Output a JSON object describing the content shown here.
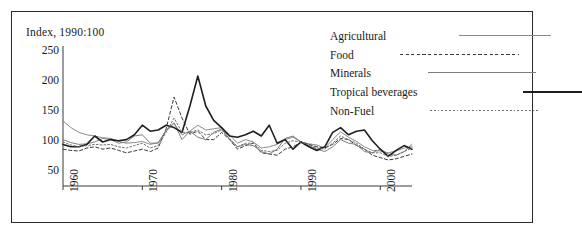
{
  "title": "Index, 1990:100",
  "legend": {
    "position": "top-right",
    "entries": [
      {
        "label": "Agricultural",
        "style": "solid",
        "color": "#8a8a8a",
        "width": 1,
        "key_x": 73,
        "key_w": 92
      },
      {
        "label": "Food",
        "style": "dashed",
        "color": "#3a3a3a",
        "width": 1,
        "key_x": 46,
        "key_w": 119
      },
      {
        "label": "Minerals",
        "style": "solid",
        "color": "#7e7e7e",
        "width": 1,
        "key_x": 57,
        "key_w": 108
      },
      {
        "label": "Tropical beverages",
        "style": "solid",
        "color": "#1f1f1f",
        "width": 1.6,
        "key_x": 106,
        "key_w": 59
      },
      {
        "label": "Non-Fuel",
        "style": "dotted",
        "color": "#6f6f6f",
        "width": 1,
        "key_x": 56,
        "key_w": 109
      }
    ]
  },
  "axes": {
    "y_ticks": [
      "250",
      "200",
      "150",
      "100",
      "50"
    ],
    "y_values": [
      250,
      200,
      150,
      100,
      50
    ],
    "x_ticks": [
      "1960",
      "1970",
      "1980",
      "1990",
      "2000"
    ],
    "x_values": [
      1960,
      1970,
      1980,
      1990,
      2000
    ],
    "ylim": [
      25,
      265
    ],
    "xlim": [
      1960,
      2004
    ]
  },
  "chart_data": {
    "type": "line",
    "title": "Index, 1990:100",
    "xlabel": "",
    "ylabel": "Index, 1990:100",
    "ylim": [
      25,
      265
    ],
    "xlim": [
      1960,
      2004
    ],
    "grid": false,
    "legend_position": "top-right",
    "x": [
      1960,
      1961,
      1962,
      1963,
      1964,
      1965,
      1966,
      1967,
      1968,
      1969,
      1970,
      1971,
      1972,
      1973,
      1974,
      1975,
      1976,
      1977,
      1978,
      1979,
      1980,
      1981,
      1982,
      1983,
      1984,
      1985,
      1986,
      1987,
      1988,
      1989,
      1990,
      1991,
      1992,
      1993,
      1994,
      1995,
      1996,
      1997,
      1998,
      1999,
      2000,
      2001,
      2002,
      2003,
      2004
    ],
    "series": [
      {
        "name": "Agricultural",
        "style": "solid",
        "color": "#8a8a8a",
        "width": 1,
        "values": [
          135,
          124,
          116,
          112,
          110,
          107,
          106,
          101,
          98,
          99,
          101,
          96,
          99,
          118,
          131,
          112,
          118,
          128,
          120,
          122,
          124,
          112,
          98,
          104,
          100,
          90,
          92,
          96,
          104,
          108,
          100,
          97,
          95,
          90,
          104,
          117,
          108,
          101,
          92,
          86,
          85,
          82,
          85,
          90,
          92
        ]
      },
      {
        "name": "Food",
        "style": "dashed",
        "color": "#3a3a3a",
        "width": 1,
        "values": [
          88,
          86,
          85,
          90,
          92,
          88,
          90,
          86,
          82,
          85,
          88,
          84,
          90,
          122,
          175,
          140,
          113,
          118,
          104,
          104,
          116,
          104,
          88,
          94,
          98,
          82,
          80,
          78,
          88,
          92,
          100,
          96,
          92,
          90,
          96,
          106,
          104,
          94,
          88,
          78,
          74,
          70,
          72,
          76,
          80
        ]
      },
      {
        "name": "Minerals",
        "style": "solid",
        "color": "#7e7e7e",
        "width": 1,
        "values": [
          104,
          99,
          96,
          97,
          100,
          106,
          104,
          98,
          100,
          110,
          112,
          98,
          98,
          120,
          132,
          104,
          118,
          108,
          104,
          116,
          122,
          104,
          92,
          96,
          94,
          84,
          80,
          88,
          106,
          110,
          100,
          94,
          88,
          84,
          92,
          104,
          98,
          96,
          84,
          82,
          88,
          80,
          78,
          84,
          96
        ]
      },
      {
        "name": "Tropical beverages",
        "style": "solid",
        "color": "#1f1f1f",
        "width": 1.6,
        "values": [
          96,
          92,
          92,
          96,
          110,
          100,
          104,
          102,
          104,
          112,
          128,
          118,
          120,
          128,
          124,
          116,
          160,
          210,
          160,
          136,
          124,
          110,
          108,
          112,
          118,
          110,
          128,
          98,
          104,
          88,
          100,
          92,
          86,
          92,
          116,
          124,
          112,
          118,
          120,
          102,
          88,
          76,
          86,
          94,
          88
        ]
      },
      {
        "name": "Non-Fuel",
        "style": "dotted",
        "color": "#6f6f6f",
        "width": 1,
        "values": [
          100,
          95,
          92,
          94,
          96,
          95,
          96,
          92,
          90,
          94,
          98,
          90,
          94,
          116,
          140,
          116,
          116,
          120,
          112,
          114,
          120,
          106,
          92,
          98,
          98,
          86,
          84,
          86,
          98,
          102,
          100,
          95,
          90,
          88,
          98,
          110,
          104,
          98,
          88,
          82,
          82,
          76,
          78,
          84,
          90
        ]
      }
    ]
  }
}
